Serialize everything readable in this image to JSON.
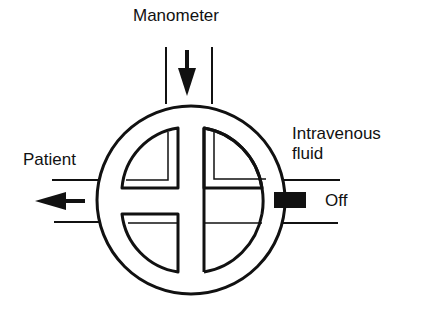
{
  "diagram": {
    "type": "three-way stopcock valve",
    "labels": {
      "top": "Manometer",
      "left": "Patient",
      "right_line1": "Intravenous",
      "right_line2": "fluid",
      "handle": "Off"
    },
    "ports": [
      {
        "name": "Manometer",
        "position": "top",
        "flow_arrow": "down"
      },
      {
        "name": "Patient",
        "position": "left",
        "flow_arrow": "left"
      },
      {
        "name": "Intravenous fluid",
        "position": "right",
        "state": "Off"
      }
    ],
    "colors": {
      "stroke": "#111111",
      "background": "#ffffff"
    }
  }
}
